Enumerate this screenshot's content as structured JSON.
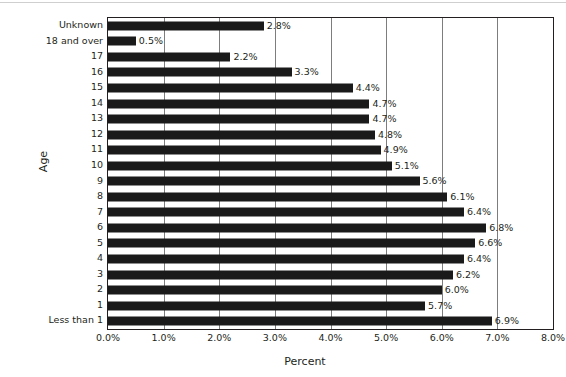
{
  "chart_data": {
    "type": "bar",
    "orientation": "horizontal",
    "title": "",
    "xlabel": "Percent",
    "ylabel": "Age",
    "xlim": [
      0,
      8
    ],
    "xticks": [
      "0.0%",
      "1.0%",
      "2.0%",
      "3.0%",
      "4.0%",
      "5.0%",
      "6.0%",
      "7.0%",
      "8.0%"
    ],
    "xtick_values": [
      0,
      1,
      2,
      3,
      4,
      5,
      6,
      7,
      8
    ],
    "grid": "vertical",
    "legend": "none",
    "bar_color": "#1a1a1a",
    "gridline_color": "#7d7d7d",
    "axis_color": "#231f20",
    "categories": [
      "Unknown",
      "18 and over",
      "17",
      "16",
      "15",
      "14",
      "13",
      "12",
      "11",
      "10",
      "9",
      "8",
      "7",
      "6",
      "5",
      "4",
      "3",
      "2",
      "1",
      "Less than 1"
    ],
    "values": [
      2.8,
      0.5,
      2.2,
      3.3,
      4.4,
      4.7,
      4.7,
      4.8,
      4.9,
      5.1,
      5.6,
      6.1,
      6.4,
      6.8,
      6.6,
      6.4,
      6.2,
      6.0,
      5.7,
      6.9
    ],
    "data_labels": [
      "2.8%",
      "0.5%",
      "2.2%",
      "3.3%",
      "4.4%",
      "4.7%",
      "4.7%",
      "4.8%",
      "4.9%",
      "5.1%",
      "5.6%",
      "6.1%",
      "6.4%",
      "6.8%",
      "6.6%",
      "6.4%",
      "6.2%",
      "6.0%",
      "5.7%",
      "6.9%"
    ]
  }
}
